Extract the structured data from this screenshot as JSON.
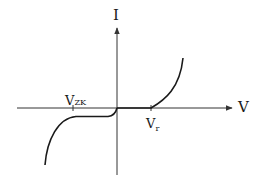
{
  "diagram": {
    "type": "zener-diode-iv-characteristic",
    "axes": {
      "x_label": "V",
      "y_label": "I"
    },
    "markers": [
      {
        "id": "vzk",
        "main": "V",
        "sub": "ZK",
        "description": "Zener knee voltage (reverse breakdown)"
      },
      {
        "id": "vr",
        "main": "V",
        "sub": "r",
        "description": "Forward threshold voltage"
      }
    ],
    "colors": {
      "stroke": "#1a1a1a",
      "axis": "#333333",
      "background": "#ffffff"
    }
  }
}
